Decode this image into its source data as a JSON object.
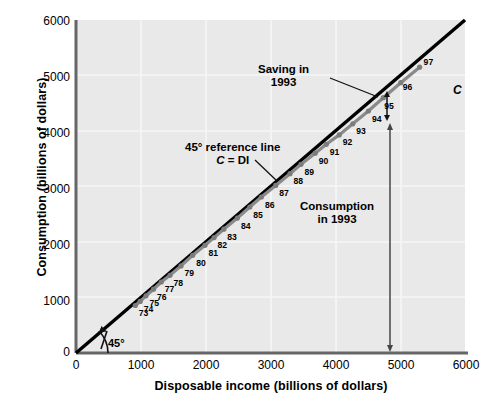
{
  "chart_data": {
    "type": "scatter",
    "title": "",
    "xlabel": "Disposable income (billions of dollars)",
    "ylabel": "Consumption (billions of dollars)",
    "xlim": [
      0,
      6000
    ],
    "ylim": [
      0,
      6000
    ],
    "xticks": [
      "0",
      "1000",
      "2000",
      "3000",
      "4000",
      "5000",
      "6000"
    ],
    "yticks": [
      "0",
      "1000",
      "2000",
      "3000",
      "4000",
      "5000",
      "6000"
    ],
    "grid": true,
    "legend": "none",
    "series": [
      {
        "name": "45 degree reference line C = DI",
        "type": "line",
        "color": "#000000",
        "x": [
          0,
          6000
        ],
        "y": [
          0,
          6000
        ]
      },
      {
        "name": "C consumption function",
        "type": "scatter-line",
        "color": "#8a8a8a",
        "point_labels": [
          "73",
          "74",
          "75",
          "76",
          "77",
          "78",
          "79",
          "80",
          "81",
          "82",
          "83",
          "84",
          "85",
          "86",
          "87",
          "88",
          "89",
          "90",
          "91",
          "92",
          "93",
          "94",
          "95",
          "96",
          "97"
        ],
        "x": [
          915,
          990,
          1080,
          1195,
          1315,
          1450,
          1620,
          1800,
          1990,
          2130,
          2280,
          2490,
          2680,
          2860,
          3080,
          3300,
          3470,
          3690,
          3860,
          4060,
          4270,
          4510,
          4740,
          5010,
          5300
        ],
        "y": [
          855,
          930,
          1030,
          1150,
          1280,
          1400,
          1570,
          1760,
          1940,
          2080,
          2230,
          2430,
          2630,
          2810,
          3020,
          3230,
          3400,
          3600,
          3760,
          3930,
          4130,
          4360,
          4600,
          4870,
          5150
        ]
      }
    ],
    "annotations": [
      {
        "name": "saving-in-1993",
        "text_lines": [
          "Saving in",
          "1993"
        ],
        "note": "double-headed arrow between 45-degree line and C curve at DI = 4800"
      },
      {
        "name": "reference-line-label",
        "text_lines": [
          "45° reference line",
          "C = DI"
        ],
        "note": "leader line pointing to the black 45-degree line"
      },
      {
        "name": "consumption-in-1993",
        "text_lines": [
          "Consumption",
          "in 1993"
        ],
        "note": "vertical arrow from the 1993 point down to the horizontal axis at DI = 4800"
      },
      {
        "name": "curve-label-c",
        "text_lines": [
          "C"
        ],
        "note": "italic C labeling the consumption function"
      },
      {
        "name": "angle-45",
        "text_lines": [
          "45°"
        ],
        "note": "arc arrow at origin marking the 45-degree angle"
      }
    ]
  },
  "axes": {
    "y_title": "Consumption (billions of dollars)",
    "x_title": "Disposable income (billions of dollars)",
    "y_ticks": [
      "6000",
      "5000",
      "4000",
      "3000",
      "2000",
      "1000",
      "0"
    ],
    "x_ticks": [
      "0",
      "1000",
      "2000",
      "3000",
      "4000",
      "5000",
      "6000"
    ]
  },
  "annotations": {
    "saving_line1": "Saving in",
    "saving_line2": "1993",
    "refline_line1": "45° reference line",
    "refline_c": "C",
    "refline_eq": " = DI",
    "consumption_line1": "Consumption",
    "consumption_line2": "in 1993",
    "curve_label": "C",
    "angle_label": "45°"
  },
  "point_labels": [
    "73",
    "74",
    "75",
    "76",
    "77",
    "78",
    "79",
    "80",
    "81",
    "82",
    "83",
    "84",
    "85",
    "86",
    "87",
    "88",
    "89",
    "90",
    "91",
    "92",
    "93",
    "94",
    "95",
    "96",
    "97"
  ],
  "colors": {
    "plot_background": "#e9e9e9",
    "grid": "#f7f7f7",
    "axis": "#555555",
    "reference_line": "#111111",
    "consumption_line": "#8a8a8a",
    "text": "#000000"
  }
}
